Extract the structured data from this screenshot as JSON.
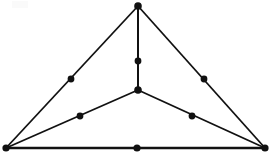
{
  "diagram": {
    "canvas": {
      "width": 272,
      "height": 157,
      "background": "#ffffff"
    },
    "style": {
      "line_color": "#111111",
      "node_color": "#111111",
      "thin_stroke_width": 1.6,
      "thick_stroke_width": 2.6,
      "node_radius": 3.4,
      "apex_node_radius": 3.8
    },
    "vertices": [
      {
        "id": "apex",
        "label": "A",
        "role": "triangle-corner",
        "x": 138,
        "y": 6,
        "r": 3.8
      },
      {
        "id": "bottom-left",
        "label": "B",
        "role": "triangle-corner",
        "x": 6,
        "y": 148,
        "r": 3.6
      },
      {
        "id": "bottom-right",
        "label": "C",
        "role": "triangle-corner",
        "x": 265,
        "y": 148,
        "r": 3.6
      },
      {
        "id": "center",
        "label": "O",
        "role": "interior-vertex",
        "x": 138,
        "y": 90,
        "r": 3.8
      }
    ],
    "midpoints": [
      {
        "id": "mid-apex-center",
        "on_edge": "apex-center",
        "x": 138,
        "y": 61,
        "r": 3.4
      },
      {
        "id": "mid-apex-left",
        "on_edge": "apex-bottom-left",
        "x": 71,
        "y": 79,
        "r": 3.4
      },
      {
        "id": "mid-apex-right",
        "on_edge": "apex-bottom-right",
        "x": 204,
        "y": 79,
        "r": 3.4
      },
      {
        "id": "mid-center-left",
        "on_edge": "center-bottom-left",
        "x": 80,
        "y": 116,
        "r": 3.4
      },
      {
        "id": "mid-center-right",
        "on_edge": "center-bottom-right",
        "x": 192,
        "y": 116,
        "r": 3.4
      },
      {
        "id": "mid-bottom",
        "on_edge": "bottom-left-right",
        "x": 137,
        "y": 148,
        "r": 3.6
      }
    ],
    "edges": [
      {
        "id": "edge-apex-left",
        "from": "apex",
        "to": "bottom-left",
        "x1": 138,
        "y1": 6,
        "x2": 6,
        "y2": 148,
        "width": 1.8
      },
      {
        "id": "edge-apex-right",
        "from": "apex",
        "to": "bottom-right",
        "x1": 138,
        "y1": 6,
        "x2": 265,
        "y2": 148,
        "width": 1.8
      },
      {
        "id": "edge-apex-center",
        "from": "apex",
        "to": "center",
        "x1": 138,
        "y1": 6,
        "x2": 138,
        "y2": 90,
        "width": 2.0
      },
      {
        "id": "edge-center-left",
        "from": "center",
        "to": "bottom-left",
        "x1": 138,
        "y1": 90,
        "x2": 6,
        "y2": 148,
        "width": 1.8
      },
      {
        "id": "edge-center-right",
        "from": "center",
        "to": "bottom-right",
        "x1": 138,
        "y1": 90,
        "x2": 265,
        "y2": 148,
        "width": 1.8
      },
      {
        "id": "edge-bottom",
        "from": "bottom-left",
        "to": "bottom-right",
        "x1": 6,
        "y1": 148,
        "x2": 265,
        "y2": 148,
        "width": 2.6
      }
    ],
    "artifacts": [
      {
        "id": "faint-top-left-speck",
        "x": 12,
        "y": 1,
        "width": 16,
        "height": 7,
        "color": "#fafafa"
      }
    ],
    "counts": {
      "vertex_count": 4,
      "midpoint_count": 6,
      "edge_count": 6
    }
  }
}
